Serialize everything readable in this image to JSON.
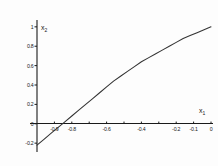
{
  "chart_data": {
    "type": "line",
    "title": "",
    "subtitle": "",
    "xlabel": "x1",
    "ylabel": "x2",
    "xlabel_display": "x",
    "xlabel_sub": "1",
    "ylabel_display": "x",
    "ylabel_sub": "2",
    "grid": false,
    "legend": null,
    "xlim": [
      -1.0,
      0.0
    ],
    "ylim": [
      -0.25,
      1.05
    ],
    "xticks": [
      -0.9,
      -0.8,
      -0.7,
      -0.6,
      -0.5,
      -0.4,
      -0.3,
      -0.2,
      -0.1,
      0
    ],
    "xticklabels": [
      "-0.9",
      "-0.8",
      "",
      "-0.6",
      "",
      "-0.4",
      "",
      "-0.2",
      "-0.1",
      "0"
    ],
    "xticklabels_visible": [
      "-0.9",
      "-0.8",
      "-0.6",
      "-0.4",
      "-0.2",
      "-0.1",
      "0"
    ],
    "yticks": [
      -0.2,
      0,
      0.2,
      0.4,
      0.6,
      0.8,
      1
    ],
    "yticklabels": [
      "-0.2",
      "0",
      "0.2",
      "0.4",
      "0.6",
      "0.8",
      "1"
    ],
    "series": [
      {
        "name": "curve",
        "color": "#333333",
        "x": [
          -1.0,
          -0.96,
          -0.92,
          -0.88,
          -0.84,
          -0.8,
          -0.76,
          -0.72,
          -0.68,
          -0.64,
          -0.6,
          -0.56,
          -0.52,
          -0.48,
          -0.44,
          -0.4,
          -0.36,
          -0.32,
          -0.28,
          -0.24,
          -0.2,
          -0.16,
          -0.12,
          -0.08,
          -0.04,
          0.0
        ],
        "y": [
          -0.22,
          -0.16,
          -0.1,
          -0.04,
          0.02,
          0.08,
          0.14,
          0.2,
          0.26,
          0.32,
          0.38,
          0.44,
          0.49,
          0.54,
          0.59,
          0.64,
          0.68,
          0.72,
          0.76,
          0.8,
          0.84,
          0.88,
          0.91,
          0.94,
          0.97,
          1.0
        ]
      }
    ],
    "x_axis_crossing": -0.85
  },
  "figure": {
    "background_color": "#ffffff",
    "axis_color": "#1a1a1a",
    "curve_color": "#333333"
  }
}
